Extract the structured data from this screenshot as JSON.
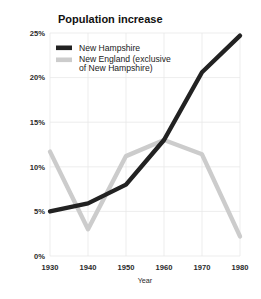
{
  "chart_data": {
    "type": "line",
    "title": "Population increase",
    "xlabel": "Year",
    "ylabel": "",
    "x": [
      1930,
      1940,
      1950,
      1960,
      1970,
      1980
    ],
    "xtick_labels": [
      "1930",
      "1940",
      "1950",
      "1960",
      "1970",
      "1980"
    ],
    "ytick_labels": [
      "0%",
      "5%",
      "10%",
      "15%",
      "20%",
      "25%"
    ],
    "ytick_values": [
      0,
      5,
      10,
      15,
      20,
      25
    ],
    "xlim": [
      1930,
      1980
    ],
    "ylim": [
      0,
      25
    ],
    "grid": true,
    "legend_position": "top-left",
    "series": [
      {
        "name": "New Hampshire",
        "color": "#222222",
        "values": [
          5.0,
          5.9,
          8.0,
          13.0,
          20.6,
          24.7
        ]
      },
      {
        "name": "New England (exclusive of New Hampshire)",
        "legend_line1": "New England (exclusive",
        "legend_line2": "of New Hampshire)",
        "color": "#cccccc",
        "values": [
          11.7,
          3.0,
          11.2,
          13.0,
          11.4,
          2.2
        ]
      }
    ]
  },
  "colors": {
    "series_dark": "#222222",
    "series_light": "#cccccc",
    "grid": "#e9e9e9",
    "text": "#1a1a1a",
    "background": "#ffffff"
  }
}
